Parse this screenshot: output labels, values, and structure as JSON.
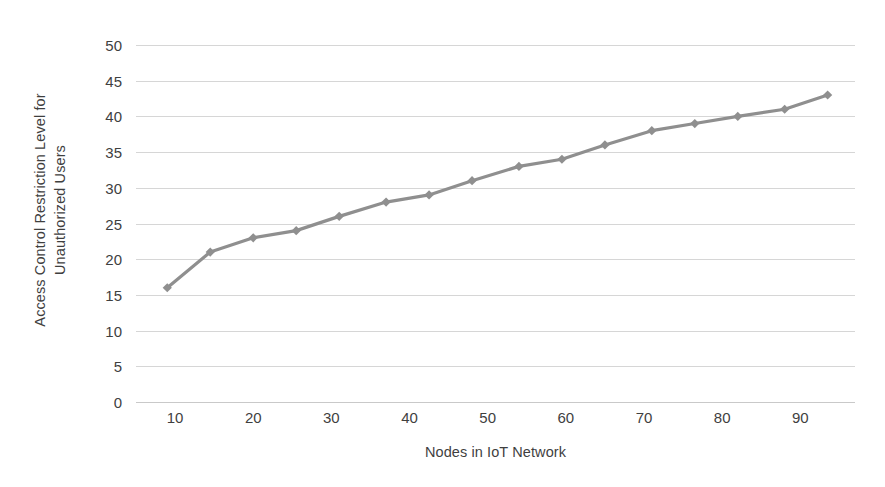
{
  "chart_data": {
    "type": "line",
    "title": "",
    "xlabel": "Nodes in IoT Network",
    "ylabel": "Access Control Restriction Level for Unauthorized Users",
    "ylabel_lines": [
      "Access Control Restriction Level for",
      "Unauthorized Users"
    ],
    "x": [
      9,
      14.5,
      20,
      25.5,
      31,
      37,
      42.5,
      48,
      54,
      59.5,
      65,
      71,
      76.5,
      82,
      88,
      93.5
    ],
    "values": [
      16,
      21,
      23,
      24,
      26,
      28,
      29,
      31,
      33,
      34,
      36,
      38,
      39,
      40,
      41,
      43
    ],
    "series": [
      {
        "name": "Access Control Restriction Level",
        "values": [
          16,
          21,
          23,
          24,
          26,
          28,
          29,
          31,
          33,
          34,
          36,
          38,
          39,
          40,
          41,
          43
        ]
      }
    ],
    "xlim": [
      5,
      97
    ],
    "ylim": [
      0,
      50
    ],
    "xticks": [
      10,
      20,
      30,
      40,
      50,
      60,
      70,
      80,
      90
    ],
    "xtick_labels": [
      "10",
      "20",
      "30",
      "40",
      "50",
      "60",
      "70",
      "80",
      "90"
    ],
    "yticks": [
      0,
      5,
      10,
      15,
      20,
      25,
      30,
      35,
      40,
      45,
      50
    ],
    "ytick_labels": [
      "0",
      "5",
      "10",
      "15",
      "20",
      "25",
      "30",
      "35",
      "40",
      "45",
      "50"
    ],
    "grid": true,
    "grid_axis": "y",
    "legend": false,
    "legend_position": "none",
    "marker": "diamond",
    "line_color": "#8f8f8f",
    "marker_color": "#8f8f8f",
    "grid_color": "#d6d6d6",
    "text_color": "#3f3f3f",
    "background_color": "#ffffff"
  }
}
